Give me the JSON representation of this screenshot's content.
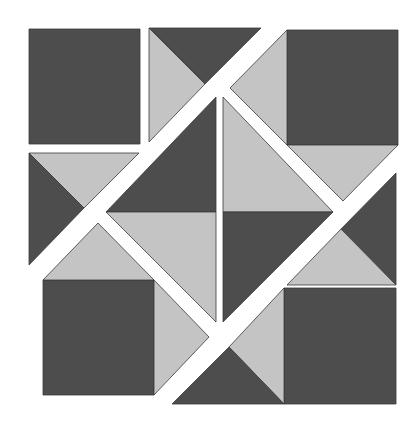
{
  "canvas": {
    "width": 419,
    "height": 430,
    "background": "#ffffff"
  },
  "colors": {
    "dark": "#4d4d4d",
    "light": "#c4c4c4",
    "outline": "#3a3a3a"
  },
  "pieces": [
    {
      "name": "top-left-square",
      "tone": "dark",
      "points": "29,29 140,29 140,144 29,144"
    },
    {
      "name": "top-middle-light-triangle",
      "tone": "light",
      "points": "149,28 149,142 205,84"
    },
    {
      "name": "top-middle-dark-triangle",
      "tone": "dark",
      "points": "149,28 261,28 205,84"
    },
    {
      "name": "top-right-square",
      "tone": "dark",
      "points": "287,30 398,30 398,145 287,145"
    },
    {
      "name": "top-right-left-light-triangle",
      "tone": "light",
      "points": "287,30 230,88 287,145"
    },
    {
      "name": "top-right-bottom-light-triangle",
      "tone": "light",
      "points": "287,145 398,145 343,201"
    },
    {
      "name": "left-middle-light-triangle",
      "tone": "light",
      "points": "29,153 139,153 84,208"
    },
    {
      "name": "left-middle-dark-triangle",
      "tone": "dark",
      "points": "29,153 84,208 29,265"
    },
    {
      "name": "center-top-left-dark-triangle",
      "tone": "dark",
      "points": "216,97 216,212 106,212"
    },
    {
      "name": "center-bottom-left-light-triangle",
      "tone": "light",
      "points": "106,212 216,212 216,322"
    },
    {
      "name": "center-top-right-light-triangle",
      "tone": "light",
      "points": "223,97 333,212 223,212"
    },
    {
      "name": "center-bottom-right-dark-triangle",
      "tone": "dark",
      "points": "223,212 333,212 223,322"
    },
    {
      "name": "bottom-left-square",
      "tone": "dark",
      "points": "43,280 154,280 154,395 43,395"
    },
    {
      "name": "bottom-left-top-light-triangle",
      "tone": "light",
      "points": "43,280 154,280 98,223"
    },
    {
      "name": "bottom-left-right-light-triangle",
      "tone": "light",
      "points": "154,280 209,337 154,395"
    },
    {
      "name": "right-middle-dark-triangle",
      "tone": "dark",
      "points": "396,173 396,285 341,229"
    },
    {
      "name": "right-middle-light-triangle",
      "tone": "light",
      "points": "287,285 341,229 396,285"
    },
    {
      "name": "bottom-right-square",
      "tone": "dark",
      "points": "284,288 396,288 396,404 284,404"
    },
    {
      "name": "bottom-right-left-light-triangle",
      "tone": "light",
      "points": "284,288 284,404 229,347"
    },
    {
      "name": "bottom-middle-dark-triangle",
      "tone": "dark",
      "points": "172,404 284,404 229,347"
    }
  ]
}
